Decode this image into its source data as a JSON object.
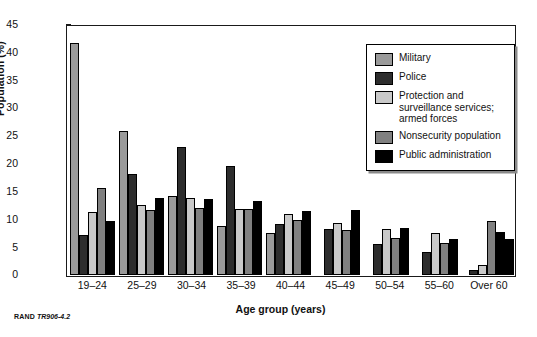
{
  "footer": {
    "publisher": "RAND",
    "figure_number": "TR906-4.2"
  },
  "legend": {
    "entries": [
      {
        "label": "Military",
        "color": "#9a9a9a"
      },
      {
        "label": "Police",
        "color": "#2d2d2d"
      },
      {
        "label": "Protection and surveillance services; armed forces",
        "color": "#c9c9c9"
      },
      {
        "label": "Nonsecurity population",
        "color": "#808080"
      },
      {
        "label": "Public administration",
        "color": "#000000"
      }
    ]
  },
  "chart_data": {
    "type": "bar",
    "title": "",
    "xlabel": "Age group (years)",
    "ylabel": "Population (%)",
    "ylim": [
      0,
      45
    ],
    "yticks": [
      0,
      5,
      10,
      15,
      20,
      25,
      30,
      35,
      40,
      45
    ],
    "grid": false,
    "legend_position": "top-right",
    "categories": [
      "19–24",
      "25–29",
      "30–34",
      "35–39",
      "40–44",
      "45–49",
      "50–54",
      "55–60",
      "Over 60"
    ],
    "series": [
      {
        "name": "Military",
        "color": "#9a9a9a",
        "values": [
          41.8,
          26.0,
          14.3,
          8.8,
          7.7,
          null,
          null,
          null,
          null
        ]
      },
      {
        "name": "Police",
        "color": "#2d2d2d",
        "values": [
          7.2,
          18.3,
          23.1,
          19.6,
          9.3,
          8.4,
          5.6,
          4.2,
          1.0
        ]
      },
      {
        "name": "Protection and surveillance services; armed forces",
        "color": "#c9c9c9",
        "values": [
          11.4,
          12.6,
          14.0,
          12.0,
          11.0,
          9.5,
          8.4,
          7.7,
          1.9
        ]
      },
      {
        "name": "Nonsecurity population",
        "color": "#808080",
        "values": [
          15.7,
          11.8,
          12.2,
          11.9,
          9.9,
          8.2,
          6.7,
          5.9,
          9.8
        ]
      },
      {
        "name": "Public administration",
        "color": "#000000",
        "values": [
          9.8,
          14.0,
          13.7,
          13.3,
          11.5,
          11.8,
          8.6,
          6.6,
          7.8
        ]
      }
    ],
    "extra_bars": {
      "note": "Over 60 group shows an additional bar",
      "over60_last": 6.5
    }
  }
}
